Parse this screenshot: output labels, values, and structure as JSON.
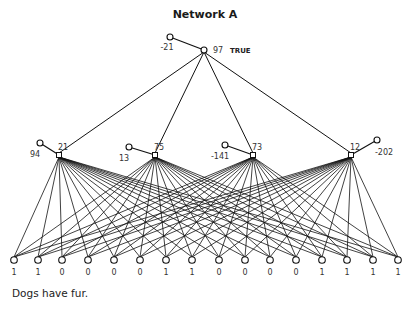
{
  "title": "Network A",
  "caption": "Dogs have fur.",
  "output": {
    "activation": "97",
    "verdict": "TRUE",
    "bias": "-21",
    "x": 204,
    "y": 50,
    "bias_x": 170,
    "bias_y": 37
  },
  "hidden": [
    {
      "activation": "21",
      "bias": "94",
      "x": 59,
      "y": 155,
      "bias_x": 40,
      "bias_y": 143,
      "bias_side": "left"
    },
    {
      "activation": "75",
      "bias": "13",
      "x": 155,
      "y": 155,
      "bias_x": 129,
      "bias_y": 147,
      "bias_side": "left"
    },
    {
      "activation": "73",
      "bias": "-141",
      "x": 253,
      "y": 155,
      "bias_x": 225,
      "bias_y": 145,
      "bias_side": "left"
    },
    {
      "activation": "12",
      "bias": "-202",
      "x": 351,
      "y": 155,
      "bias_x": 377,
      "bias_y": 140,
      "bias_side": "right"
    }
  ],
  "inputs": {
    "y": 260,
    "x": [
      14,
      38,
      62,
      88,
      114,
      140,
      166,
      192,
      219,
      245,
      270,
      296,
      322,
      347,
      373,
      398
    ],
    "values": [
      "1",
      "1",
      "0",
      "0",
      "0",
      "0",
      "1",
      "1",
      "0",
      "0",
      "0",
      "0",
      "1",
      "1",
      "1",
      "1"
    ]
  }
}
